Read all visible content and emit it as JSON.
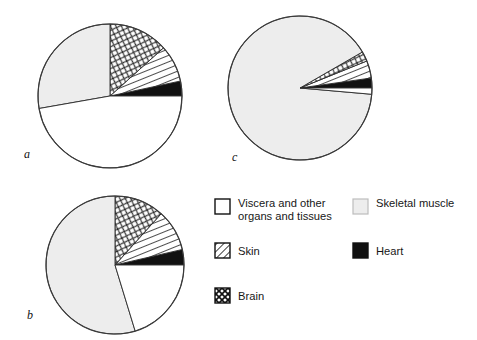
{
  "figure": {
    "background_color": "#ffffff",
    "panels": [
      {
        "id": "a",
        "label": "a"
      },
      {
        "id": "b",
        "label": "b"
      },
      {
        "id": "c",
        "label": "c"
      }
    ]
  },
  "legend": {
    "position": "bottom-right",
    "entries": [
      {
        "key": "viscera",
        "label": "Viscera and other organs and tissues",
        "label_line1": "Viscera and other",
        "label_line2": "organs and tissues",
        "swatch": "white-square-swatch",
        "fill": "#ffffff",
        "pattern": "solid"
      },
      {
        "key": "skeletal_muscle",
        "label": "Skeletal muscle",
        "label_line1": "Skeletal muscle",
        "label_line2": "",
        "swatch": "light-gray-square-swatch",
        "fill": "#ededed",
        "pattern": "solid"
      },
      {
        "key": "skin",
        "label": "Skin",
        "label_line1": "Skin",
        "label_line2": "",
        "swatch": "diagonal-hatch-square-swatch",
        "fill": "#ffffff",
        "pattern": "diagonal-lines"
      },
      {
        "key": "heart",
        "label": "Heart",
        "label_line1": "Heart",
        "label_line2": "",
        "swatch": "black-square-swatch",
        "fill": "#111111",
        "pattern": "solid"
      },
      {
        "key": "brain",
        "label": "Brain",
        "label_line1": "Brain",
        "label_line2": "",
        "swatch": "crosshatch-square-swatch",
        "fill": "#ffffff",
        "pattern": "crosshatch"
      }
    ]
  },
  "chart_data": {
    "type": "pie",
    "title": "",
    "xlabel": "",
    "ylabel": "",
    "legend_position": "bottom-right",
    "grid": false,
    "category_order": [
      "Heart",
      "Skin",
      "Brain",
      "Skeletal muscle",
      "Viscera and other organs and tissues"
    ],
    "charts": [
      {
        "panel": "a",
        "center": [
          110,
          96
        ],
        "radius": 72,
        "categories": [
          "Heart",
          "Skin",
          "Brain",
          "Skeletal muscle",
          "Viscera and other organs and tissues"
        ],
        "values": [
          3.3,
          8.3,
          13.3,
          27.8,
          47.3
        ],
        "angles_deg": [
          12,
          30,
          48,
          100,
          170
        ],
        "start_angle_deg": 0
      },
      {
        "panel": "b",
        "center": [
          115,
          265
        ],
        "radius": 69,
        "categories": [
          "Heart",
          "Skin",
          "Brain",
          "Skeletal muscle",
          "Viscera and other organs and tissues"
        ],
        "values": [
          3.6,
          9.7,
          11.7,
          54.7,
          20.3
        ],
        "angles_deg": [
          13,
          35,
          42,
          197,
          73
        ],
        "start_angle_deg": 0
      },
      {
        "panel": "c",
        "center": [
          300,
          88
        ],
        "radius": 72,
        "categories": [
          "Heart",
          "Skin",
          "Brain",
          "Skeletal muscle",
          "Viscera and other organs and tissues"
        ],
        "values": [
          2.2,
          3.9,
          2.2,
          90.3,
          1.4
        ],
        "angles_deg": [
          8,
          14,
          8,
          325,
          5
        ],
        "start_angle_deg": 0
      }
    ]
  }
}
